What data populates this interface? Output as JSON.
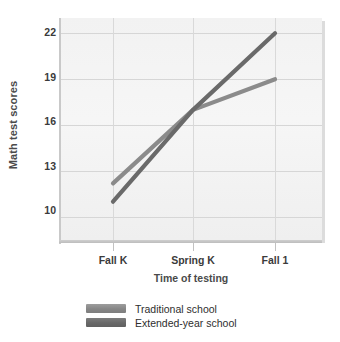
{
  "chart_data": {
    "type": "line",
    "title": "",
    "xlabel": "Time of testing",
    "ylabel": "Math test scores",
    "categories": [
      "Fall K",
      "Spring K",
      "Fall 1"
    ],
    "x": [
      0,
      1,
      2
    ],
    "ylim": [
      8.5,
      23.0
    ],
    "yticks": [
      10,
      13,
      16,
      19,
      22
    ],
    "ytick_labels": [
      "10",
      "13",
      "16",
      "19",
      "22"
    ],
    "grid": true,
    "legend_position": "below",
    "series": [
      {
        "name": "Traditional school",
        "values": [
          12.2,
          17.0,
          19.0
        ],
        "color": "#8b8b8b"
      },
      {
        "name": "Extended-year school",
        "values": [
          11.0,
          17.0,
          22.0
        ],
        "color": "#6a6a6a"
      }
    ]
  },
  "axes": {
    "y_title": "Math test scores",
    "x_title": "Time of testing",
    "y_tick_labels": [
      "22",
      "19",
      "16",
      "13",
      "10"
    ],
    "x_tick_labels": [
      "Fall K",
      "Spring K",
      "Fall 1"
    ]
  },
  "legend": {
    "items": [
      {
        "label": "Traditional school",
        "color": "#8b8b8b"
      },
      {
        "label": "Extended-year school",
        "color": "#6a6a6a"
      }
    ]
  },
  "colors": {
    "plot_background": "#f3f3f3",
    "grid": "#d6d6d6",
    "axis": "#c4c4c4",
    "text": "#333333",
    "series_traditional": "#8b8b8b",
    "series_extended": "#6a6a6a"
  }
}
